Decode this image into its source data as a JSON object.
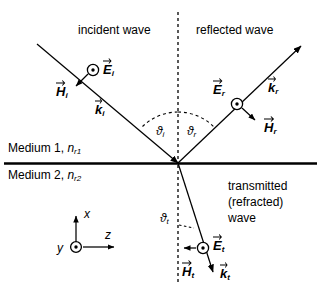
{
  "figure": {
    "background_color": "#ffffff",
    "line_color": "#000000"
  },
  "region_labels": {
    "incident_wave": "incident wave",
    "reflected_wave": "reflected wave",
    "transmitted_line_1": "transmitted",
    "transmitted_line_2": "(refracted)",
    "transmitted_line_3": "wave"
  },
  "media": {
    "upper": {
      "name": "Medium 1,",
      "index_symbol": "n",
      "index_subscript": "r1"
    },
    "lower": {
      "name": "Medium 2,",
      "index_symbol": "n",
      "index_subscript": "r2"
    }
  },
  "angles": {
    "incidence": {
      "symbol": "ϑ",
      "subscript": "i"
    },
    "reflection": {
      "symbol": "ϑ",
      "subscript": "r"
    },
    "transmission": {
      "symbol": "ϑ",
      "subscript": "t"
    }
  },
  "vectors": {
    "incident": {
      "E": {
        "symbol": "E",
        "subscript": "i",
        "representation": "out-of-page-dot"
      },
      "H": {
        "symbol": "H",
        "subscript": "i",
        "representation": "in-plane-arrow"
      },
      "k": {
        "symbol": "k",
        "subscript": "i",
        "representation": "ray-direction"
      }
    },
    "reflected": {
      "E": {
        "symbol": "E",
        "subscript": "r",
        "representation": "out-of-page-dot"
      },
      "H": {
        "symbol": "H",
        "subscript": "r",
        "representation": "in-plane-arrow"
      },
      "k": {
        "symbol": "k",
        "subscript": "r",
        "representation": "ray-direction"
      }
    },
    "transmitted": {
      "E": {
        "symbol": "E",
        "subscript": "t",
        "representation": "out-of-page-dot"
      },
      "H": {
        "symbol": "H",
        "subscript": "t",
        "representation": "in-plane-arrow"
      },
      "k": {
        "symbol": "k",
        "subscript": "t",
        "representation": "ray-direction"
      }
    }
  },
  "coordinate_system": {
    "x_axis": "x",
    "y_axis": "y",
    "z_axis": "z",
    "y_representation": "out-of-page-dot"
  }
}
